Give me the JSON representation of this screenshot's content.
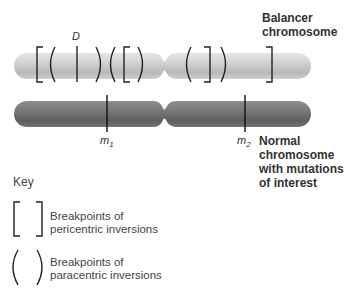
{
  "balancer": {
    "label_line1": "Balancer",
    "label_line2": "chromosome",
    "marker_label": "D",
    "color": "#c8c8c8"
  },
  "normal": {
    "label_line1": "Normal",
    "label_line2": "chromosome",
    "label_line3": "with mutations",
    "label_line4": "of interest",
    "marker1_label": "m",
    "marker1_sub": "1",
    "marker2_label": "m",
    "marker2_sub": "2",
    "color": "#7a7a7a"
  },
  "key": {
    "title": "Key",
    "items": [
      {
        "symbol": "[ ]",
        "line1": "Breakpoints of",
        "line2": "pericentric inversions"
      },
      {
        "symbol": "( )",
        "line1": "Breakpoints of",
        "line2": "paracentric inversions"
      }
    ]
  }
}
